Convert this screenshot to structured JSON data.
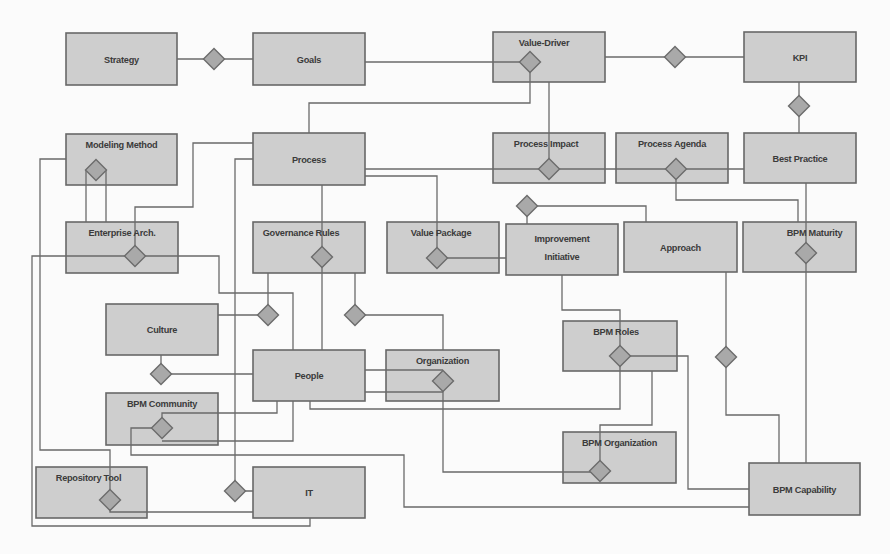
{
  "diagram": {
    "colors": {
      "box_fill": "#cecece",
      "box_stroke": "#686868",
      "line": "#6a6a6a",
      "diamond_fill": "#a9a9a9"
    },
    "entities": [
      {
        "id": "strategy",
        "label": [
          "Strategy"
        ],
        "x": 66,
        "y": 33,
        "w": 111,
        "h": 52,
        "pos": "center"
      },
      {
        "id": "goals",
        "label": [
          "Goals"
        ],
        "x": 253,
        "y": 33,
        "w": 112,
        "h": 52,
        "pos": "center"
      },
      {
        "id": "value-driver",
        "label": [
          "Value-Driver"
        ],
        "x": 493,
        "y": 32,
        "w": 112,
        "h": 50,
        "pos": "top",
        "dx": -5
      },
      {
        "id": "kpi",
        "label": [
          "KPI"
        ],
        "x": 744,
        "y": 32,
        "w": 112,
        "h": 50,
        "pos": "center"
      },
      {
        "id": "modeling-method",
        "label": [
          "Modeling Method"
        ],
        "x": 66,
        "y": 134,
        "w": 111,
        "h": 51,
        "pos": "top"
      },
      {
        "id": "process",
        "label": [
          "Process"
        ],
        "x": 253,
        "y": 133,
        "w": 112,
        "h": 52,
        "pos": "center"
      },
      {
        "id": "process-impact",
        "label": [
          "Process Impact"
        ],
        "x": 493,
        "y": 133,
        "w": 112,
        "h": 50,
        "pos": "top",
        "dx": -3
      },
      {
        "id": "process-agenda",
        "label": [
          "Process Agenda"
        ],
        "x": 616,
        "y": 133,
        "w": 112,
        "h": 50,
        "pos": "top"
      },
      {
        "id": "best-practice",
        "label": [
          "Best Practice"
        ],
        "x": 744,
        "y": 133,
        "w": 112,
        "h": 50,
        "pos": "center"
      },
      {
        "id": "enterprise-arch",
        "label": [
          "Enterprise Arch."
        ],
        "x": 66,
        "y": 222,
        "w": 112,
        "h": 51,
        "pos": "top"
      },
      {
        "id": "governance-rules",
        "label": [
          "Governance Rules"
        ],
        "x": 253,
        "y": 222,
        "w": 112,
        "h": 51,
        "pos": "top",
        "dx": -8
      },
      {
        "id": "value-package",
        "label": [
          "Value Package"
        ],
        "x": 387,
        "y": 222,
        "w": 112,
        "h": 51,
        "pos": "top",
        "dx": -2
      },
      {
        "id": "improvement-initiative",
        "label": [
          "Improvement",
          "Initiative"
        ],
        "x": 506,
        "y": 224,
        "w": 112,
        "h": 51,
        "pos": "two"
      },
      {
        "id": "approach",
        "label": [
          "Approach"
        ],
        "x": 624,
        "y": 222,
        "w": 113,
        "h": 50,
        "pos": "center"
      },
      {
        "id": "bpm-maturity",
        "label": [
          "BPM Maturity"
        ],
        "x": 743,
        "y": 222,
        "w": 113,
        "h": 50,
        "pos": "top",
        "dx": 15
      },
      {
        "id": "culture",
        "label": [
          "Culture"
        ],
        "x": 106,
        "y": 304,
        "w": 112,
        "h": 51,
        "pos": "center"
      },
      {
        "id": "people",
        "label": [
          "People"
        ],
        "x": 253,
        "y": 350,
        "w": 112,
        "h": 51,
        "pos": "center"
      },
      {
        "id": "organization",
        "label": [
          "Organization"
        ],
        "x": 386,
        "y": 350,
        "w": 113,
        "h": 51,
        "pos": "top"
      },
      {
        "id": "bpm-roles",
        "label": [
          "BPM Roles"
        ],
        "x": 563,
        "y": 321,
        "w": 114,
        "h": 50,
        "pos": "top",
        "dx": -4
      },
      {
        "id": "bpm-community",
        "label": [
          "BPM Community"
        ],
        "x": 106,
        "y": 393,
        "w": 112,
        "h": 52,
        "pos": "top"
      },
      {
        "id": "bpm-organization",
        "label": [
          "BPM Organization"
        ],
        "x": 563,
        "y": 432,
        "w": 113,
        "h": 51,
        "pos": "top"
      },
      {
        "id": "repository-tool",
        "label": [
          "Repository Tool"
        ],
        "x": 36,
        "y": 467,
        "w": 111,
        "h": 51,
        "pos": "top",
        "dx": -3
      },
      {
        "id": "it",
        "label": [
          "IT"
        ],
        "x": 253,
        "y": 467,
        "w": 112,
        "h": 51,
        "pos": "center"
      },
      {
        "id": "bpm-capability",
        "label": [
          "BPM Capability"
        ],
        "x": 749,
        "y": 463,
        "w": 111,
        "h": 52,
        "pos": "center"
      }
    ],
    "connectors": [
      [
        [
          177,
          59
        ],
        [
          253,
          59
        ]
      ],
      [
        [
          365,
          62
        ],
        [
          530,
          62
        ]
      ],
      [
        [
          530,
          62
        ],
        [
          530,
          103
        ],
        [
          309,
          103
        ],
        [
          309,
          133
        ]
      ],
      [
        [
          605,
          57
        ],
        [
          744,
          57
        ]
      ],
      [
        [
          549,
          82
        ],
        [
          549,
          169
        ]
      ],
      [
        [
          799,
          82
        ],
        [
          799,
          133
        ]
      ],
      [
        [
          365,
          169
        ],
        [
          744,
          169
        ]
      ],
      [
        [
          365,
          176
        ],
        [
          437,
          176
        ],
        [
          437,
          258
        ]
      ],
      [
        [
          437,
          258
        ],
        [
          506,
          258
        ]
      ],
      [
        [
          527,
          206
        ],
        [
          646,
          206
        ],
        [
          646,
          222
        ]
      ],
      [
        [
          527,
          206
        ],
        [
          527,
          224
        ]
      ],
      [
        [
          676,
          169
        ],
        [
          676,
          200
        ],
        [
          798,
          200
        ],
        [
          798,
          222
        ]
      ],
      [
        [
          806,
          183
        ],
        [
          806,
          463
        ]
      ],
      [
        [
          726,
          272
        ],
        [
          726,
          415
        ],
        [
          779,
          415
        ],
        [
          779,
          463
        ]
      ],
      [
        [
          562,
          275
        ],
        [
          562,
          310
        ],
        [
          620,
          310
        ],
        [
          620,
          356
        ]
      ],
      [
        [
          620,
          356
        ],
        [
          688,
          356
        ],
        [
          688,
          489
        ],
        [
          749,
          489
        ]
      ],
      [
        [
          620,
          356
        ],
        [
          620,
          409
        ],
        [
          310,
          409
        ],
        [
          310,
          401
        ]
      ],
      [
        [
          652,
          371
        ],
        [
          652,
          425
        ],
        [
          600,
          425
        ],
        [
          600,
          471
        ]
      ],
      [
        [
          443,
          381
        ],
        [
          443,
          472
        ],
        [
          600,
          472
        ]
      ],
      [
        [
          365,
          370
        ],
        [
          443,
          370
        ]
      ],
      [
        [
          365,
          392
        ],
        [
          443,
          392
        ]
      ],
      [
        [
          355,
          273
        ],
        [
          355,
          315
        ],
        [
          443,
          315
        ],
        [
          443,
          350
        ]
      ],
      [
        [
          322,
          185
        ],
        [
          322,
          350
        ]
      ],
      [
        [
          268,
          273
        ],
        [
          268,
          315
        ],
        [
          218,
          315
        ]
      ],
      [
        [
          135,
          256
        ],
        [
          219,
          256
        ],
        [
          219,
          293
        ],
        [
          293,
          293
        ],
        [
          293,
          350
        ]
      ],
      [
        [
          135,
          256
        ],
        [
          32,
          256
        ],
        [
          32,
          526
        ],
        [
          310,
          526
        ],
        [
          310,
          518
        ]
      ],
      [
        [
          253,
          143
        ],
        [
          193,
          143
        ],
        [
          193,
          207
        ],
        [
          135,
          207
        ],
        [
          135,
          256
        ]
      ],
      [
        [
          253,
          159
        ],
        [
          235,
          159
        ],
        [
          235,
          491
        ],
        [
          253,
          491
        ]
      ],
      [
        [
          66,
          159
        ],
        [
          40,
          159
        ],
        [
          40,
          450
        ],
        [
          110,
          450
        ],
        [
          110,
          500
        ]
      ],
      [
        [
          86,
          170
        ],
        [
          86,
          222
        ]
      ],
      [
        [
          106,
          170
        ],
        [
          106,
          222
        ]
      ],
      [
        [
          161,
          355
        ],
        [
          161,
          374
        ],
        [
          253,
          374
        ]
      ],
      [
        [
          277,
          401
        ],
        [
          277,
          413
        ],
        [
          162,
          413
        ],
        [
          162,
          428
        ]
      ],
      [
        [
          293,
          401
        ],
        [
          293,
          441
        ],
        [
          162,
          441
        ]
      ],
      [
        [
          162,
          428
        ],
        [
          131,
          428
        ],
        [
          131,
          455
        ],
        [
          404,
          455
        ],
        [
          404,
          507
        ],
        [
          749,
          507
        ]
      ],
      [
        [
          110,
          500
        ],
        [
          110,
          512
        ],
        [
          253,
          512
        ]
      ]
    ],
    "relations": [
      {
        "id": "strategy-goals",
        "cx": 214,
        "cy": 59
      },
      {
        "id": "value-driver-link",
        "cx": 530,
        "cy": 62
      },
      {
        "id": "value-driver-kpi",
        "cx": 675,
        "cy": 57
      },
      {
        "id": "kpi-best-practice",
        "cx": 799,
        "cy": 106
      },
      {
        "id": "modeling-method-link",
        "cx": 96,
        "cy": 170
      },
      {
        "id": "process-impact-link",
        "cx": 549,
        "cy": 169
      },
      {
        "id": "process-agenda-link",
        "cx": 676,
        "cy": 169
      },
      {
        "id": "enterprise-arch-link",
        "cx": 135,
        "cy": 256
      },
      {
        "id": "governance-rules-link",
        "cx": 322,
        "cy": 257
      },
      {
        "id": "value-package-link",
        "cx": 437,
        "cy": 258
      },
      {
        "id": "improvement-initiative-link",
        "cx": 527,
        "cy": 206
      },
      {
        "id": "bpm-maturity-link",
        "cx": 806,
        "cy": 253
      },
      {
        "id": "culture-governance",
        "cx": 268,
        "cy": 315
      },
      {
        "id": "governance-organization",
        "cx": 355,
        "cy": 315
      },
      {
        "id": "culture-people",
        "cx": 161,
        "cy": 374
      },
      {
        "id": "organization-link",
        "cx": 443,
        "cy": 381
      },
      {
        "id": "bpm-roles-link",
        "cx": 620,
        "cy": 356
      },
      {
        "id": "approach-capability",
        "cx": 726,
        "cy": 357
      },
      {
        "id": "bpm-community-link",
        "cx": 162,
        "cy": 428
      },
      {
        "id": "bpm-organization-link",
        "cx": 600,
        "cy": 471
      },
      {
        "id": "repository-tool-link",
        "cx": 110,
        "cy": 500
      },
      {
        "id": "it-link",
        "cx": 235,
        "cy": 491
      }
    ]
  }
}
